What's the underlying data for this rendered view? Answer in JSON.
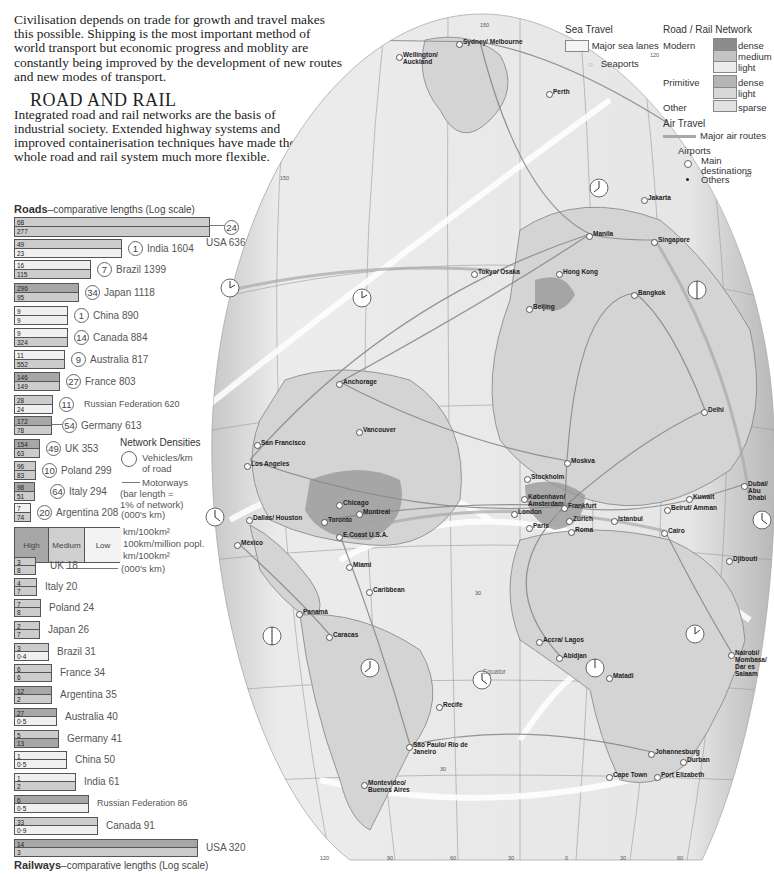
{
  "intro_text": "Civilisation depends on trade for growth and travel makes this possible. Shipping is the most important method of world transport but economic progress and moblity are constantly being improved by the development of new routes and new modes of transport.",
  "section": {
    "heading": "ROAD AND RAIL",
    "body": "Integrated road and rail networks are the basis of industrial society. Extended highway systems and improved containerisation techniques have made the whole road and rail system much more flexible."
  },
  "roads_title": {
    "bold": "Roads",
    "rest": "–comparative lengths (Log scale)"
  },
  "railways_title": {
    "bold": "Railways",
    "rest": "–comparative lengths (Log scale)"
  },
  "density_legend": {
    "title": "Network Densities",
    "circle_label": "Vehicles/km of road",
    "motorways_label": "Motorways",
    "bar_note": "(bar length = 1% of network)",
    "units_note": "(000's km)",
    "levels": [
      "High",
      "Medium",
      "Low"
    ],
    "row_labels": [
      "km/100km²",
      "100km/million popl.",
      "km/100km²"
    ],
    "rail_units_note": "(000's km)"
  },
  "colors": {
    "high": "#a7a7a7",
    "medium": "#cccccc",
    "low": "#f0f0f0",
    "map_land": "#d8d8d8",
    "map_sea": "#ececec",
    "dense_modern": "#8c8c8c"
  },
  "chart_data": [
    {
      "type": "bar",
      "title": "Roads – comparative lengths (Log scale)",
      "unit": "000's km",
      "categories": [
        "USA",
        "India",
        "Brazil",
        "Japan",
        "China",
        "Canada",
        "Australia",
        "France",
        "Russian Federation",
        "Germany",
        "UK",
        "Poland",
        "Italy",
        "Argentina"
      ],
      "values": [
        6366,
        1604,
        1399,
        1118,
        890,
        884,
        817,
        803,
        620,
        613,
        353,
        299,
        294,
        208
      ],
      "series": [
        {
          "name": "Vehicles/km of road",
          "values": [
            24,
            1,
            7,
            34,
            1,
            14,
            9,
            27,
            11,
            54,
            49,
            10,
            64,
            20
          ]
        },
        {
          "name": "km/100km² (top half)",
          "values": [
            68,
            49,
            16,
            296,
            9,
            9,
            11,
            146,
            28,
            172,
            154,
            96,
            98,
            7
          ]
        },
        {
          "name": "100km/million popl. (bottom half)",
          "values": [
            277,
            23,
            115,
            95,
            9,
            324,
            552,
            149,
            24,
            78,
            63,
            83,
            51,
            74
          ]
        }
      ]
    },
    {
      "type": "bar",
      "title": "Railways – comparative lengths (Log scale)",
      "unit": "000's km",
      "categories": [
        "UK",
        "Italy",
        "Poland",
        "Japan",
        "Brazil",
        "France",
        "Argentina",
        "Australia",
        "Germany",
        "China",
        "India",
        "Russian Federation",
        "Canada",
        "USA"
      ],
      "values": [
        18,
        20,
        24,
        26,
        31,
        34,
        35,
        40,
        41,
        50,
        61,
        86,
        91,
        320
      ],
      "series": [
        {
          "name": "km/100km² (top half)",
          "values": [
            3,
            4,
            7,
            2,
            3,
            6,
            12,
            27,
            5,
            1,
            1,
            6,
            33,
            14
          ]
        },
        {
          "name": "100km/million popl. (bottom half)",
          "values": [
            8,
            7,
            8,
            7,
            0.4,
            6,
            2,
            0.5,
            13,
            0.5,
            2,
            0.5,
            0.9,
            3
          ]
        }
      ]
    }
  ],
  "roads": [
    {
      "country": "USA 6366",
      "w": 196,
      "top": "68",
      "bot": "277",
      "tc": "medium",
      "bc": "medium",
      "veh": "24",
      "motor": true
    },
    {
      "country": "India 1604",
      "w": 108,
      "top": "49",
      "bot": "23",
      "tc": "medium",
      "bc": "low",
      "veh": "1"
    },
    {
      "country": "Brazil 1399",
      "w": 77,
      "top": "16",
      "bot": "115",
      "tc": "low",
      "bc": "medium",
      "veh": "7"
    },
    {
      "country": "Japan 1118",
      "w": 65,
      "top": "296",
      "bot": "95",
      "tc": "high",
      "bc": "medium",
      "veh": "34",
      "motor": true
    },
    {
      "country": "China 890",
      "w": 54,
      "top": "9",
      "bot": "9",
      "tc": "low",
      "bc": "low",
      "veh": "1"
    },
    {
      "country": "Canada 884",
      "w": 54,
      "top": "9",
      "bot": "324",
      "tc": "low",
      "bc": "medium",
      "veh": "14"
    },
    {
      "country": "Australia 817",
      "w": 51,
      "top": "11",
      "bot": "552",
      "tc": "low",
      "bc": "medium",
      "veh": "9"
    },
    {
      "country": "France 803",
      "w": 46,
      "top": "146",
      "bot": "149",
      "tc": "high",
      "bc": "medium",
      "veh": "27",
      "motor": true
    },
    {
      "country": "Russian Federation 620",
      "w": 39,
      "top": "28",
      "bot": "24",
      "tc": "medium",
      "bc": "low",
      "veh": "11"
    },
    {
      "country": "Germany 613",
      "w": 38,
      "top": "172",
      "bot": "78",
      "tc": "high",
      "bc": "medium",
      "veh": "54",
      "motor": true
    },
    {
      "country": "UK 353",
      "w": 26,
      "top": "154",
      "bot": "63",
      "tc": "high",
      "bc": "medium",
      "veh": "49",
      "motor": true
    },
    {
      "country": "Poland 299",
      "w": 22,
      "top": "96",
      "bot": "83",
      "tc": "medium",
      "bc": "medium",
      "veh": "10"
    },
    {
      "country": "Italy 294",
      "w": 21,
      "top": "98",
      "bot": "51",
      "tc": "high",
      "bc": "medium",
      "veh": "64",
      "motor": true
    },
    {
      "country": "Argentina 208",
      "w": 17,
      "top": "7",
      "bot": "74",
      "tc": "low",
      "bc": "medium",
      "veh": "20"
    }
  ],
  "rails": [
    {
      "country": "UK 18",
      "w": 22,
      "top": "3",
      "bot": "8",
      "tc": "medium",
      "bc": "medium"
    },
    {
      "country": "Italy 20",
      "w": 23,
      "top": "4",
      "bot": "7",
      "tc": "medium",
      "bc": "medium"
    },
    {
      "country": "Poland 24",
      "w": 27,
      "top": "7",
      "bot": "8",
      "tc": "medium",
      "bc": "medium"
    },
    {
      "country": "Japan 26",
      "w": 26,
      "top": "2",
      "bot": "7",
      "tc": "medium",
      "bc": "medium"
    },
    {
      "country": "Brazil 31",
      "w": 35,
      "top": "3",
      "bot": "0·4",
      "tc": "medium",
      "bc": "low"
    },
    {
      "country": "France 34",
      "w": 38,
      "top": "6",
      "bot": "6",
      "tc": "medium",
      "bc": "medium"
    },
    {
      "country": "Argentina 35",
      "w": 38,
      "top": "12",
      "bot": "2",
      "tc": "high",
      "bc": "medium"
    },
    {
      "country": "Australia 40",
      "w": 43,
      "top": "27",
      "bot": "0·5",
      "tc": "high",
      "bc": "low"
    },
    {
      "country": "Germany 41",
      "w": 45,
      "top": "5",
      "bot": "13",
      "tc": "medium",
      "bc": "high"
    },
    {
      "country": "China 50",
      "w": 53,
      "top": "1",
      "bot": "0·5",
      "tc": "low",
      "bc": "low"
    },
    {
      "country": "India 61",
      "w": 62,
      "top": "1",
      "bot": "2",
      "tc": "low",
      "bc": "medium"
    },
    {
      "country": "Russian Federation 86",
      "w": 75,
      "top": "6",
      "bot": "0·5",
      "tc": "high",
      "bc": "low"
    },
    {
      "country": "Canada 91",
      "w": 84,
      "top": "33",
      "bot": "0·9",
      "tc": "medium",
      "bc": "low"
    },
    {
      "country": "USA 320",
      "w": 184,
      "top": "14",
      "bot": "3",
      "tc": "high",
      "bc": "medium"
    }
  ],
  "map_legend": {
    "sea_travel": {
      "title": "Sea Travel",
      "lanes": "Major sea lanes",
      "ports": "Seaports"
    },
    "network": {
      "title": "Road / Rail Network",
      "modern": "Modern",
      "primitive": "Primitive",
      "other": "Other",
      "modern_levels": [
        "dense",
        "medium",
        "light"
      ],
      "primitive_levels": [
        "dense",
        "light"
      ],
      "other_levels": [
        "sparse"
      ]
    },
    "air": {
      "title": "Air Travel",
      "routes": "Major air routes",
      "airports": "Airports",
      "main": "Main destinations",
      "others": "Others"
    }
  },
  "map": {
    "cities": [
      {
        "name": "Sydney/ Melbourne",
        "x": 270,
        "y": 42
      },
      {
        "name": "Wellington/ Auckland",
        "x": 210,
        "y": 55
      },
      {
        "name": "Perth",
        "x": 360,
        "y": 92
      },
      {
        "name": "Jakarta",
        "x": 455,
        "y": 198
      },
      {
        "name": "Manila",
        "x": 400,
        "y": 234
      },
      {
        "name": "Singapore",
        "x": 465,
        "y": 240
      },
      {
        "name": "Tokyo/ Osaka",
        "x": 285,
        "y": 272
      },
      {
        "name": "Hong Kong",
        "x": 370,
        "y": 272
      },
      {
        "name": "Bangkok",
        "x": 445,
        "y": 293
      },
      {
        "name": "Beijing",
        "x": 340,
        "y": 307
      },
      {
        "name": "Anchorage",
        "x": 150,
        "y": 382
      },
      {
        "name": "Delhi",
        "x": 515,
        "y": 410
      },
      {
        "name": "Vancouver",
        "x": 170,
        "y": 430
      },
      {
        "name": "San Francisco",
        "x": 68,
        "y": 443
      },
      {
        "name": "Los Angeles",
        "x": 58,
        "y": 464
      },
      {
        "name": "Moskva",
        "x": 378,
        "y": 461
      },
      {
        "name": "Stockholm",
        "x": 338,
        "y": 477
      },
      {
        "name": "Dubai/ Abu Dhabi",
        "x": 555,
        "y": 484
      },
      {
        "name": "Chicago",
        "x": 150,
        "y": 503
      },
      {
        "name": "København/ Amsterdam",
        "x": 335,
        "y": 497
      },
      {
        "name": "Frankfurt",
        "x": 375,
        "y": 506
      },
      {
        "name": "Kuwait",
        "x": 500,
        "y": 497
      },
      {
        "name": "Dallas/ Houston",
        "x": 60,
        "y": 518
      },
      {
        "name": "Toronto",
        "x": 135,
        "y": 520
      },
      {
        "name": "Montreal",
        "x": 170,
        "y": 512
      },
      {
        "name": "London",
        "x": 325,
        "y": 512
      },
      {
        "name": "Zürich",
        "x": 380,
        "y": 519
      },
      {
        "name": "Istanbul",
        "x": 425,
        "y": 519
      },
      {
        "name": "Beirut/ Amman",
        "x": 478,
        "y": 508
      },
      {
        "name": "E.Coast U.S.A.",
        "x": 150,
        "y": 535
      },
      {
        "name": "Paris",
        "x": 340,
        "y": 526
      },
      {
        "name": "Roma",
        "x": 382,
        "y": 530
      },
      {
        "name": "Cairo",
        "x": 475,
        "y": 531
      },
      {
        "name": "México",
        "x": 48,
        "y": 543
      },
      {
        "name": "Djibouti",
        "x": 540,
        "y": 559
      },
      {
        "name": "Miami",
        "x": 160,
        "y": 565
      },
      {
        "name": "Caribbean",
        "x": 180,
        "y": 590
      },
      {
        "name": "Panamá",
        "x": 110,
        "y": 612
      },
      {
        "name": "Caracas",
        "x": 140,
        "y": 635
      },
      {
        "name": "Nairobi/ Mombasa/ Dar es Salaam",
        "x": 542,
        "y": 653
      },
      {
        "name": "Accra/ Lagos",
        "x": 350,
        "y": 640
      },
      {
        "name": "Abidjan",
        "x": 370,
        "y": 656
      },
      {
        "name": "Equator",
        "x": 290,
        "y": 672
      },
      {
        "name": "Matadi",
        "x": 420,
        "y": 676
      },
      {
        "name": "Recife",
        "x": 250,
        "y": 705
      },
      {
        "name": "São Paulo/ Rio de Janeiro",
        "x": 220,
        "y": 745
      },
      {
        "name": "Johannesburg",
        "x": 462,
        "y": 752
      },
      {
        "name": "Durban",
        "x": 494,
        "y": 760
      },
      {
        "name": "Cape Town",
        "x": 420,
        "y": 775
      },
      {
        "name": "Port Elizabeth",
        "x": 468,
        "y": 775
      },
      {
        "name": "Montevideo/ Buenos Aires",
        "x": 175,
        "y": 783
      }
    ],
    "grid_labels": [
      {
        "t": "150",
        "x": 290,
        "y": 22
      },
      {
        "t": "120",
        "x": 460,
        "y": 52
      },
      {
        "t": "150",
        "x": 90,
        "y": 175
      },
      {
        "t": "90",
        "x": 555,
        "y": 172
      },
      {
        "t": "30",
        "x": 285,
        "y": 590
      },
      {
        "t": "30",
        "x": 250,
        "y": 766
      },
      {
        "t": "120",
        "x": 130,
        "y": 855
      },
      {
        "t": "90",
        "x": 197,
        "y": 855
      },
      {
        "t": "60",
        "x": 260,
        "y": 855
      },
      {
        "t": "30",
        "x": 318,
        "y": 855
      },
      {
        "t": "0",
        "x": 375,
        "y": 855
      },
      {
        "t": "30",
        "x": 430,
        "y": 855
      },
      {
        "t": "60",
        "x": 487,
        "y": 855
      }
    ]
  }
}
